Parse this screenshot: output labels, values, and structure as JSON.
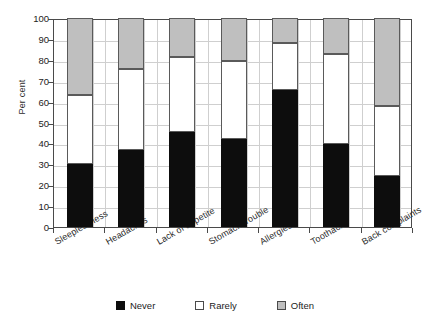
{
  "chart_data": {
    "type": "bar",
    "subtype": "stacked-bar-100-percent",
    "title": "",
    "xlabel": "",
    "ylabel": "Per cent",
    "ylim": [
      0,
      100
    ],
    "yticks": [
      0,
      10,
      20,
      30,
      40,
      50,
      60,
      70,
      80,
      90,
      100
    ],
    "ytick_labels": [
      "0",
      "10",
      "20",
      "30",
      "40",
      "50",
      "60",
      "70",
      "80",
      "90",
      "100"
    ],
    "grid": true,
    "grid_axis": "both",
    "legend_position": "bottom",
    "categories": [
      "Sleeplessness",
      "Headaches",
      "Lack of appetite",
      "Stomach trouble",
      "Allergies",
      "Toothache",
      "Back complaints"
    ],
    "series": [
      {
        "name": "Never",
        "color": "#0d0d0d",
        "values": [
          30,
          37,
          45.5,
          42,
          65.5,
          39.5,
          24.5
        ]
      },
      {
        "name": "Rarely",
        "color": "#ffffff",
        "values": [
          33,
          38.5,
          36,
          37.5,
          22.5,
          43.5,
          33.5
        ]
      },
      {
        "name": "Often",
        "color": "#bfbfbf",
        "values": [
          37,
          24.5,
          18.5,
          20.5,
          12,
          17,
          42
        ]
      }
    ],
    "cumulative_tops": {
      "never": [
        30,
        37,
        45.5,
        42,
        65.5,
        39.5,
        24.5
      ],
      "rarely": [
        63,
        75.5,
        81.5,
        79.5,
        88,
        83,
        58
      ],
      "often": [
        100,
        100,
        100,
        100,
        100,
        100,
        100
      ]
    }
  },
  "legend": {
    "items": [
      {
        "label": "Never"
      },
      {
        "label": "Rarely"
      },
      {
        "label": "Often"
      }
    ]
  }
}
